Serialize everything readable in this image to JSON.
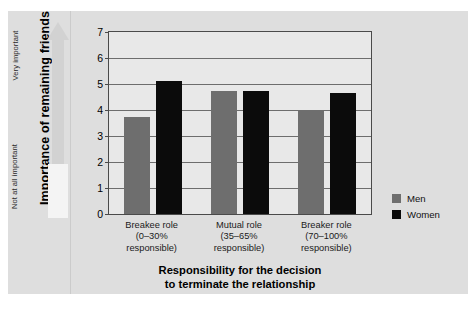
{
  "chart_data": {
    "type": "bar",
    "title": "",
    "xlabel": "Responsibility for the decision to terminate the relationship",
    "ylabel": "Importance of remaining friends",
    "categories": [
      "Breakee role (0–30% responsible)",
      "Mutual role (35–65% responsible)",
      "Breaker role (70–100% responsible)"
    ],
    "series": [
      {
        "name": "Men",
        "color": "#6e6e6e",
        "values": [
          3.75,
          4.75,
          4.0
        ]
      },
      {
        "name": "Women",
        "color": "#0b0b0b",
        "values": [
          5.1,
          4.75,
          4.65
        ]
      }
    ],
    "ylim": [
      0,
      7
    ],
    "yticks": [
      0,
      1,
      2,
      3,
      4,
      5,
      6,
      7
    ],
    "grid": true,
    "legend_position": "right"
  },
  "axis": {
    "y_title": "Importance of remaining friends",
    "y_scale_high": "Very important",
    "y_scale_low": "Not at all important",
    "y_tick_labels": [
      "7",
      "6",
      "5",
      "4",
      "3",
      "2",
      "1",
      "0"
    ],
    "x_title_line1": "Responsibility for the decision",
    "x_title_line2": "to terminate the relationship"
  },
  "categories": [
    {
      "line1": "Breakee role",
      "line2": "(0–30%",
      "line3": "responsible)"
    },
    {
      "line1": "Mutual role",
      "line2": "(35–65%",
      "line3": "responsible)"
    },
    {
      "line1": "Breaker role",
      "line2": "(70–100%",
      "line3": "responsible)"
    }
  ],
  "legend": {
    "items": [
      {
        "label": "Men",
        "color": "#6e6e6e"
      },
      {
        "label": "Women",
        "color": "#0b0b0b"
      }
    ]
  }
}
